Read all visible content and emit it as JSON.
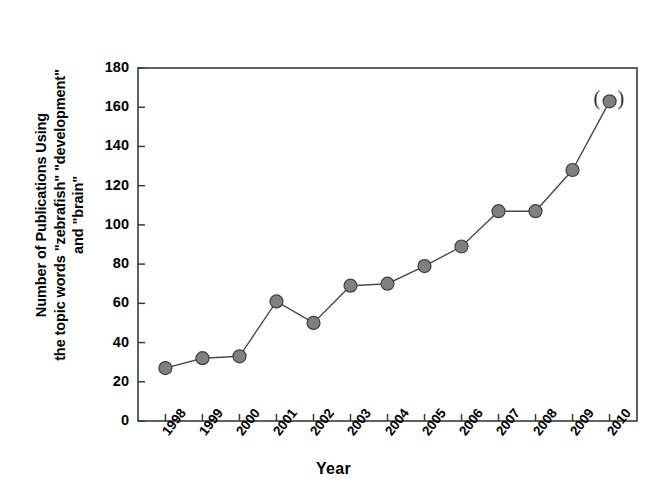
{
  "figure": {
    "background_color": "#ffffff",
    "frame_color": "#3a3a3a"
  },
  "axis": {
    "y_label_line1": "Number of Publications Using",
    "y_label_line2": "the topic words \"zebrafish\" \"development\"",
    "y_label_line3": "and \"brain\"",
    "x_label": "Year",
    "y_ticks": [
      "0",
      "20",
      "40",
      "60",
      "80",
      "100",
      "120",
      "140",
      "160",
      "180"
    ],
    "x_ticks": [
      "1998",
      "1999",
      "2000",
      "2001",
      "2002",
      "2003",
      "2004",
      "2005",
      "2006",
      "2007",
      "2008",
      "2009",
      "2010"
    ]
  },
  "annotation": {
    "left_paren": "(",
    "right_paren": ")"
  },
  "chart_data": {
    "type": "line",
    "title": "",
    "xlabel": "Year",
    "ylabel": "Number of Publications Using the topic words \"zebrafish\" \"development\" and \"brain\"",
    "categories": [
      "1998",
      "1999",
      "2000",
      "2001",
      "2002",
      "2003",
      "2004",
      "2005",
      "2006",
      "2007",
      "2008",
      "2009",
      "2010"
    ],
    "values": [
      27,
      32,
      33,
      61,
      50,
      69,
      70,
      79,
      89,
      107,
      107,
      128,
      163
    ],
    "ylim": [
      0,
      180
    ],
    "ytick_step": 20,
    "grid": false,
    "legend": "none",
    "marker": {
      "shape": "circle",
      "fill_color": "#808080",
      "edge_color": "#404040",
      "size_px": 13
    },
    "line": {
      "color": "#4a4a4a",
      "width_px": 1.4
    },
    "annotations": [
      {
        "text": "( )",
        "at_category": "2010",
        "at_value": 163,
        "description": "parenthesis marks flanking the final data point"
      }
    ]
  }
}
